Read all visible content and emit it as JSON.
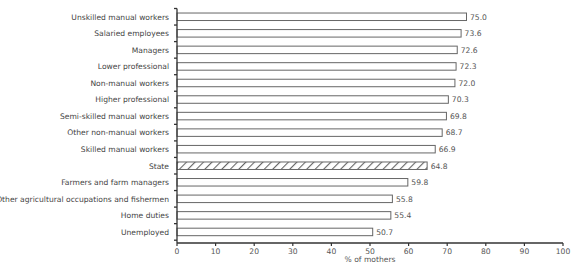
{
  "chart_data": {
    "type": "bar",
    "orientation": "horizontal",
    "title": "",
    "xlabel": "% of mothers",
    "ylabel": "",
    "xlim": [
      0,
      100
    ],
    "xticks": [
      0,
      10,
      20,
      30,
      40,
      50,
      60,
      70,
      80,
      90,
      100
    ],
    "grid": false,
    "legend": null,
    "categories": [
      "Unskilled manual workers",
      "Salaried employees",
      "Managers",
      "Lower professional",
      "Non-manual workers",
      "Higher professional",
      "Semi-skilled manual workers",
      "Other non-manual workers",
      "Skilled manual workers",
      "State",
      "Farmers and farm managers",
      "Other agricultural occupations and fishermen",
      "Home duties",
      "Unemployed"
    ],
    "values": [
      75.0,
      73.6,
      72.6,
      72.3,
      72.0,
      70.3,
      69.8,
      68.7,
      66.9,
      64.8,
      59.8,
      55.8,
      55.4,
      50.7
    ],
    "value_labels": [
      "75.0",
      "73.6",
      "72.6",
      "72.3",
      "72.0",
      "70.3",
      "69.8",
      "68.7",
      "66.9",
      "64.8",
      "59.8",
      "55.8",
      "55.4",
      "50.7"
    ],
    "highlight": {
      "category": "State",
      "style": "hatched"
    },
    "colors": {
      "bar_fill": "#ffffff",
      "bar_stroke": "#666666",
      "hatch": "#666666",
      "axis": "#333333",
      "text": "#444444"
    }
  }
}
